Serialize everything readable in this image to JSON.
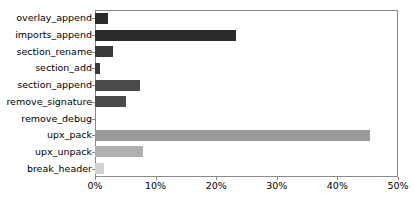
{
  "chart_data": {
    "type": "bar",
    "orientation": "horizontal",
    "title": "",
    "xlabel": "",
    "ylabel": "",
    "xlim": [
      0,
      50
    ],
    "xticks": [
      0,
      10,
      20,
      30,
      40,
      50
    ],
    "xtick_labels": [
      "0%",
      "10%",
      "20%",
      "30%",
      "40%",
      "50%"
    ],
    "grid": false,
    "legend": false,
    "categories": [
      "overlay_append",
      "imports_append",
      "section_rename",
      "section_add",
      "section_append",
      "remove_signature",
      "remove_debug",
      "upx_pack",
      "upx_unpack",
      "break_header"
    ],
    "values": [
      2.2,
      23.3,
      3.0,
      0.9,
      7.4,
      5.1,
      0.0,
      45.4,
      8.0,
      1.5
    ],
    "bar_colors": [
      "#2b2b2b",
      "#2b2b2b",
      "#3a3a3a",
      "#3a3a3a",
      "#4a4a4a",
      "#4a4a4a",
      "#555555",
      "#9a9a9a",
      "#b0b0b0",
      "#d2d2d2"
    ]
  },
  "axes": {
    "frame_color": "#8a8a8a"
  }
}
